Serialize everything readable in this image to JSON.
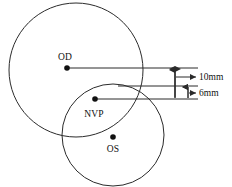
{
  "figure": {
    "background_color": "#ffffff",
    "stroke_color": "#2b2b2b",
    "text_color": "#111111"
  },
  "labels": {
    "od": "OD",
    "nvp": "NVP",
    "os": "OS"
  },
  "dimensions": {
    "large": "10mm",
    "small": "6mm"
  },
  "shapes": {
    "circle_od": {
      "cx": 76,
      "cy": 70,
      "r": 67
    },
    "circle_os": {
      "cx": 113,
      "cy": 135,
      "r": 51
    }
  },
  "points": {
    "od_center": {
      "x": 67,
      "y": 68
    },
    "nvp": {
      "x": 95,
      "y": 99
    },
    "os_center": {
      "x": 113,
      "y": 137
    }
  }
}
